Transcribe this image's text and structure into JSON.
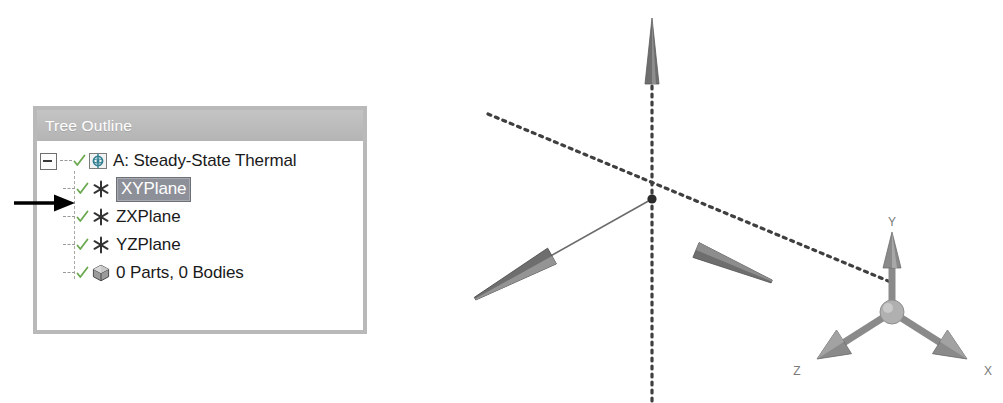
{
  "panel": {
    "title": "Tree Outline",
    "title_bar_color": "#bdbdbd",
    "title_text_color": "#ffffff",
    "border_color": "#b9b9b9",
    "background": "#ffffff"
  },
  "tree": {
    "root": {
      "label": "A: Steady-State Thermal",
      "expander": "minus-box",
      "icon": "steady-state-thermal-icon",
      "check": "green-check"
    },
    "children": [
      {
        "label": "XYPlane",
        "icon": "plane-asterisk-icon",
        "check": "green-check",
        "selected": true,
        "selection_bg": "#8e9099",
        "selection_fg": "#ffffff"
      },
      {
        "label": "ZXPlane",
        "icon": "plane-asterisk-icon",
        "check": "green-check",
        "selected": false
      },
      {
        "label": "YZPlane",
        "icon": "plane-asterisk-icon",
        "check": "green-check",
        "selected": false
      },
      {
        "label": "0 Parts, 0 Bodies",
        "icon": "parts-bodies-cube-icon",
        "check": "green-check",
        "selected": false
      }
    ]
  },
  "pointer": {
    "name": "annotation-arrow",
    "points_to": "XYPlane",
    "color": "#000000"
  },
  "viewport": {
    "name": "3d-graphics-viewport",
    "background": "#ffffff",
    "origin_marker": "origin-point",
    "axes": [
      {
        "name": "vertical-axis-line",
        "style": "dotted",
        "arrow": "cone-up",
        "color": "#4a4a4a"
      },
      {
        "name": "diagonal-axis-line",
        "style": "dotted",
        "arrow": "cone-lower-right",
        "color": "#4a4a4a"
      },
      {
        "name": "lower-left-axis-line",
        "style": "solid",
        "arrow": "cone-lower-left",
        "color": "#6b6b6b"
      }
    ]
  },
  "triad": {
    "name": "coordinate-triad",
    "hub_color": "#b0b0b0",
    "axis_color": "#8a8a8a",
    "label_color": "#7a7a7a",
    "axes": [
      {
        "axis": "Y",
        "label": "Y",
        "direction": "up"
      },
      {
        "axis": "Z",
        "label": "Z",
        "direction": "down-left"
      },
      {
        "axis": "X",
        "label": "X",
        "direction": "down-right"
      }
    ]
  }
}
